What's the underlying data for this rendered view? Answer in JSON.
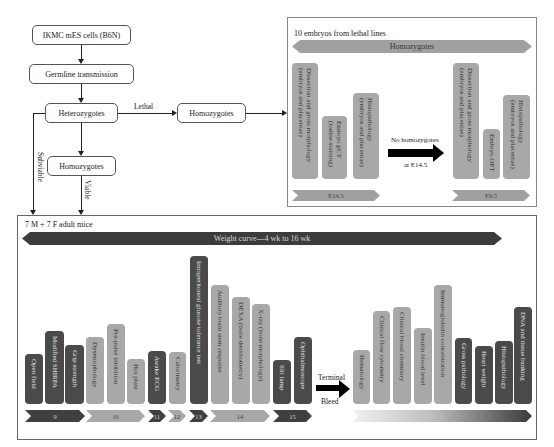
{
  "flowchart": {
    "ikmc": "IKMC mES cells (B6N)",
    "germline": "Germline transmission",
    "heterozygotes": "Heterozygotes",
    "homozygotes_lethal": "Homozygotes",
    "homozygotes_viable": "Homozygotes",
    "lethal_label": "Lethal",
    "subviable_label": "Subviable",
    "viable_label": "Viable"
  },
  "embryo_panel": {
    "title": "10 embryos from lethal lines",
    "banner": "Homozygotes",
    "e145_tests": [
      {
        "label": "Dissection and gross morphology\n(embryos and placentae)",
        "shade": "light"
      },
      {
        "label": "Embryo μCT\n(iodine staining)",
        "shade": "light"
      },
      {
        "label": "Histopathology\n(embryos and placentae)",
        "shade": "light"
      }
    ],
    "e145_stage": "E14.5",
    "transition_top": "No homozygotes",
    "transition_bottom": "at E14.5",
    "e95_tests": [
      {
        "label": "Dissection and gross morphology\n(embryos and placentae)",
        "shade": "light"
      },
      {
        "label": "Embryo OPT",
        "shade": "light"
      },
      {
        "label": "Histopathology\n(embryos and placentae)",
        "shade": "light"
      }
    ],
    "e95_stage": "E9.5"
  },
  "adult_panel": {
    "title": "7 M + 7 F adult mice",
    "banner": "Weight curve—4 wk to 16 wk",
    "tests": [
      {
        "label": "Open field",
        "shade": "dark"
      },
      {
        "label": "Modified SHIRPA",
        "shade": "dark"
      },
      {
        "label": "Grip strength",
        "shade": "dark"
      },
      {
        "label": "Dysmorphology",
        "shade": "light"
      },
      {
        "label": "Pre-pulse inhibition",
        "shade": "light"
      },
      {
        "label": "Hot plate",
        "shade": "light"
      },
      {
        "label": "Awake ECG",
        "shade": "dark"
      },
      {
        "label": "Calorimetry",
        "shade": "light"
      },
      {
        "label": "Intraperitoneal glucose tolerance test",
        "shade": "dark"
      },
      {
        "label": "Auditory brain stem response",
        "shade": "light"
      },
      {
        "label": "DEXA (bone densitometry)",
        "shade": "light"
      },
      {
        "label": "X-ray (bone morphology)",
        "shade": "light"
      },
      {
        "label": "Slit lamp",
        "shade": "dark"
      },
      {
        "label": "Ophthalmoscope",
        "shade": "dark"
      },
      {
        "label": "Hematology",
        "shade": "light"
      },
      {
        "label": "Clinical flow cytometry",
        "shade": "light"
      },
      {
        "label": "Clinical blood chemistry",
        "shade": "light"
      },
      {
        "label": "Insulin blood level",
        "shade": "light"
      },
      {
        "label": "Immunoglobulin concentration",
        "shade": "light"
      },
      {
        "label": "Gross pathology",
        "shade": "dark"
      },
      {
        "label": "Heart weight",
        "shade": "dark"
      },
      {
        "label": "Histopathology",
        "shade": "dark"
      },
      {
        "label": "DNA and tissue banking",
        "shade": "dark"
      }
    ],
    "weeks": [
      "9",
      "10",
      "11",
      "12",
      "13",
      "14",
      "15",
      "16"
    ],
    "terminal_top": "Terminal",
    "terminal_bottom": "Bleed"
  },
  "colors": {
    "dark_bar": "#4a4a4a",
    "light_bar": "#a8a8a8",
    "banner_light": "#a0a0a0",
    "banner_dark": "#3c3c3c"
  }
}
